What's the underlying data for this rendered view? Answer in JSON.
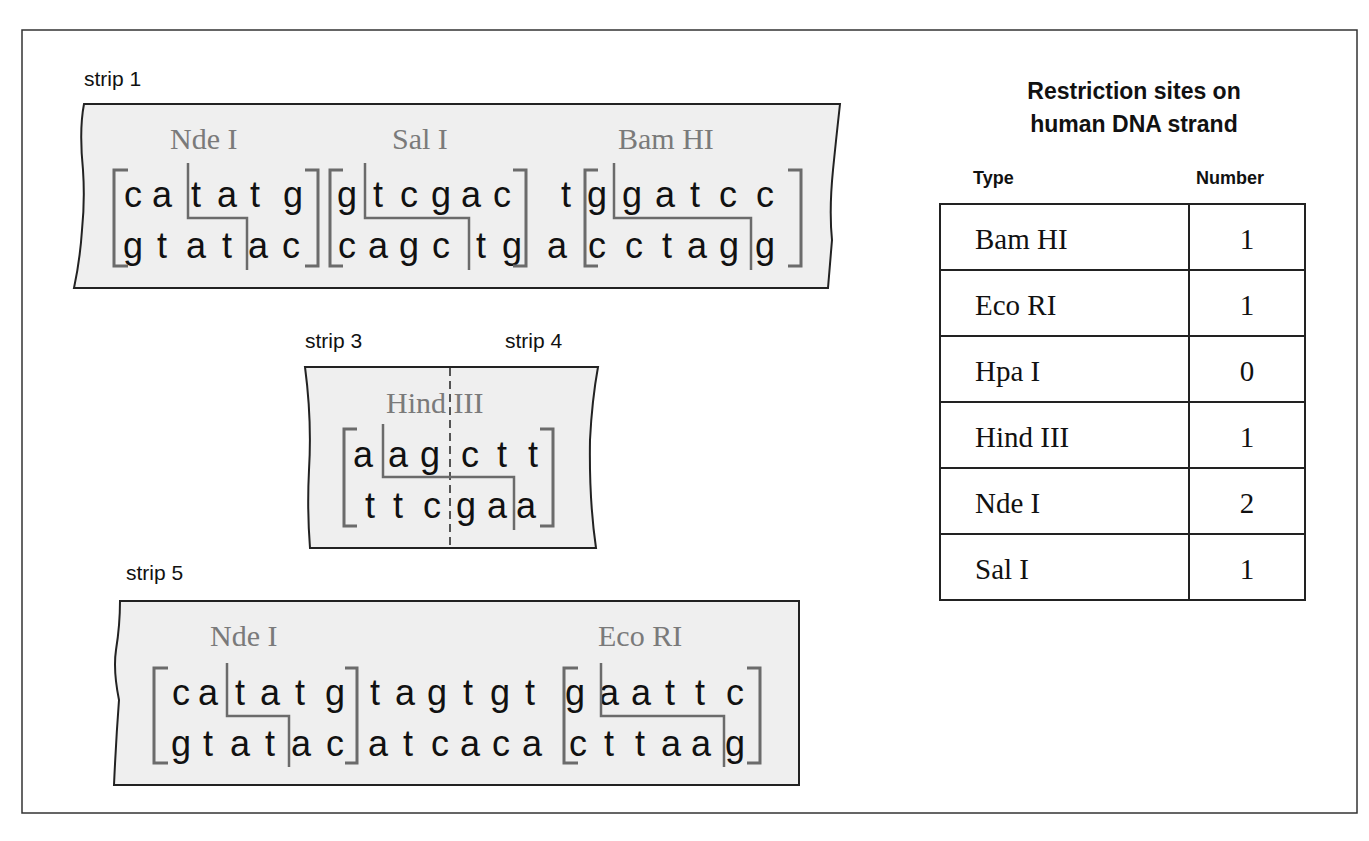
{
  "strips": {
    "strip1": {
      "label": "strip 1",
      "enzymes": [
        {
          "name": "Nde I",
          "x": 170
        },
        {
          "name": "Sal I",
          "x": 392
        },
        {
          "name": "Bam HI",
          "x": 618
        }
      ],
      "top": [
        "c",
        "a",
        "t",
        "a",
        "t",
        "g",
        "g",
        "t",
        "c",
        "g",
        "a",
        "c",
        "t",
        "g",
        "g",
        "a",
        "t",
        "c",
        "c"
      ],
      "bottom": [
        "g",
        "t",
        "a",
        "t",
        "a",
        "c",
        "c",
        "a",
        "g",
        "c",
        "t",
        "g",
        "a",
        "c",
        "c",
        "t",
        "a",
        "g",
        "g"
      ],
      "top_x": [
        133,
        162,
        196,
        227,
        255,
        293,
        347,
        378,
        409,
        441,
        471,
        502,
        566,
        597,
        632,
        665,
        695,
        728,
        765
      ],
      "bottom_x": [
        133,
        162,
        196,
        227,
        258,
        291,
        347,
        378,
        409,
        441,
        481,
        512,
        557,
        597,
        634,
        667,
        697,
        729,
        765
      ]
    },
    "strip34": {
      "label_left": "strip 3",
      "label_right": "strip 4",
      "enzymes": [
        {
          "name": "Hind III",
          "x": 386
        }
      ],
      "top": [
        "a",
        "a",
        "g",
        "c",
        "t",
        "t"
      ],
      "bottom": [
        "t",
        "t",
        "c",
        "g",
        "a",
        "a"
      ],
      "top_x": [
        363,
        398,
        430,
        470,
        502,
        533
      ],
      "bottom_x": [
        370,
        398,
        432,
        466,
        497,
        526
      ]
    },
    "strip5": {
      "label": "strip 5",
      "enzymes": [
        {
          "name": "Nde I",
          "x": 210
        },
        {
          "name": "Eco RI",
          "x": 598
        }
      ],
      "top": [
        "c",
        "a",
        "t",
        "a",
        "t",
        "g",
        "t",
        "a",
        "g",
        "t",
        "g",
        "t",
        "g",
        "a",
        "a",
        "t",
        "t",
        "c"
      ],
      "bottom": [
        "g",
        "t",
        "a",
        "t",
        "a",
        "c",
        "a",
        "t",
        "c",
        "a",
        "c",
        "a",
        "c",
        "t",
        "t",
        "a",
        "a",
        "g"
      ],
      "top_x": [
        181,
        208,
        240,
        270,
        300,
        335,
        375,
        405,
        437,
        468,
        500,
        530,
        575,
        609,
        641,
        670,
        700,
        735
      ],
      "bottom_x": [
        181,
        208,
        240,
        270,
        301,
        335,
        378,
        408,
        440,
        470,
        501,
        532,
        578,
        609,
        640,
        671,
        701,
        735
      ]
    }
  },
  "table": {
    "title_line1": "Restriction sites on",
    "title_line2": "human DNA strand",
    "header_type": "Type",
    "header_number": "Number",
    "rows": [
      {
        "type": "Bam HI",
        "number": "1"
      },
      {
        "type": "Eco RI",
        "number": "1"
      },
      {
        "type": "Hpa I",
        "number": "0"
      },
      {
        "type": "Hind III",
        "number": "1"
      },
      {
        "type": "Nde I",
        "number": "2"
      },
      {
        "type": "Sal I",
        "number": "1"
      }
    ]
  },
  "colors": {
    "strip_fill": "#efefef",
    "enzyme_label": "#7a7a7a",
    "bracket": "#6b6b6b",
    "text": "#111111"
  }
}
